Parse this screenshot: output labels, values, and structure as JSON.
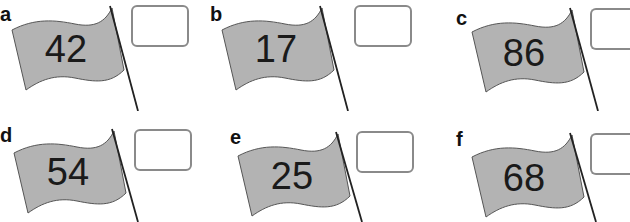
{
  "colors": {
    "flag_fill": "#b3b3b3",
    "flag_stroke": "#555555",
    "pole": "#222222",
    "box_border": "#8a8a8a"
  },
  "items": [
    {
      "label": "a",
      "number": "42",
      "answer": ""
    },
    {
      "label": "b",
      "number": "17",
      "answer": ""
    },
    {
      "label": "c",
      "number": "86",
      "answer": ""
    },
    {
      "label": "d",
      "number": "54",
      "answer": ""
    },
    {
      "label": "e",
      "number": "25",
      "answer": ""
    },
    {
      "label": "f",
      "number": "68",
      "answer": ""
    }
  ]
}
